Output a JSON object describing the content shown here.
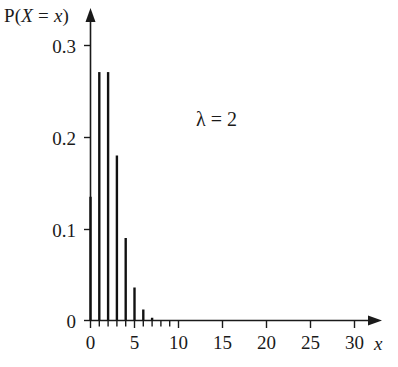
{
  "chart_data": {
    "type": "bar",
    "title": "",
    "subtitle": "",
    "xlabel": "x",
    "ylabel": "P(X = x)",
    "ylabel_parts": {
      "p": "P(",
      "x_upper": "X",
      "eq": " = ",
      "x_lower": "x",
      "close": ")"
    },
    "categories": [
      0,
      1,
      2,
      3,
      4,
      5,
      6,
      7
    ],
    "x": [
      0,
      1,
      2,
      3,
      4,
      5,
      6,
      7
    ],
    "values": [
      0.135,
      0.271,
      0.271,
      0.18,
      0.09,
      0.036,
      0.012,
      0.003
    ],
    "series": [
      {
        "name": "Poisson(2) pmf",
        "values": [
          0.135,
          0.271,
          0.271,
          0.18,
          0.09,
          0.036,
          0.012,
          0.003
        ]
      }
    ],
    "xlim": [
      0,
      32
    ],
    "ylim": [
      0,
      0.33
    ],
    "xticks": [
      0,
      5,
      10,
      15,
      20,
      25,
      30
    ],
    "xticklabels": [
      "0",
      "5",
      "10",
      "15",
      "20",
      "25",
      "30"
    ],
    "yticks": [
      0,
      0.1,
      0.2,
      0.3
    ],
    "yticklabels": [
      "0",
      "0.1",
      "0.2",
      "0.3"
    ],
    "minor_xticks": [
      1,
      2,
      3,
      4,
      6,
      7,
      8,
      9
    ],
    "grid": false,
    "legend": false,
    "legend_position": "none",
    "annotations": [
      {
        "text": "λ = 2",
        "lambda_symbol": "λ",
        "equals": "=",
        "value": "2",
        "x": 14,
        "y": 0.22
      }
    ],
    "axis_style": "arrow-tipped",
    "bar_color": "#111111",
    "axis_color": "#1a1a1a",
    "background_color": "#ffffff"
  },
  "figure": {
    "width": 398,
    "height": 367
  }
}
